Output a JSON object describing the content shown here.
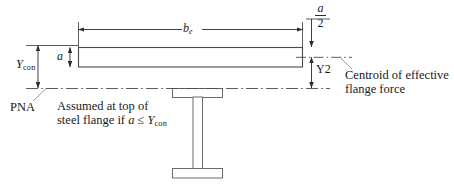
{
  "figure": {
    "type": "engineering-cross-section-diagram",
    "line_color": "#2b2b2b",
    "background_color": "#ffffff"
  },
  "dimensions": {
    "be": {
      "label_b": "b",
      "label_sub": "e",
      "name": "effective-flange-width"
    },
    "a": {
      "label": "a",
      "name": "compression-block-depth"
    },
    "a_over_2": {
      "numerator": "a",
      "denominator": "2",
      "name": "half-compression-block-depth"
    },
    "ycon": {
      "label_y": "Y",
      "label_sub": "con",
      "name": "concrete-slab-depth"
    },
    "y2": {
      "label": "Y2",
      "name": "distance-to-centroid"
    }
  },
  "annotations": {
    "pna": "PNA",
    "pna_note_line1": "Assumed at top of",
    "pna_note_line2_prefix": "steel flange if ",
    "pna_note_a": "a",
    "pna_note_leq": " ≤ ",
    "pna_note_y": "Y",
    "pna_note_y_sub": "con",
    "centroid_line1": "Centroid of effective",
    "centroid_line2": "flange force"
  },
  "shapes": {
    "concrete_slab": "concrete-slab-rectangle",
    "steel_beam": "steel-i-beam",
    "pna_axis": "pna-dash-dot-line",
    "centroid_axis": "centroid-dash-dot-line"
  }
}
